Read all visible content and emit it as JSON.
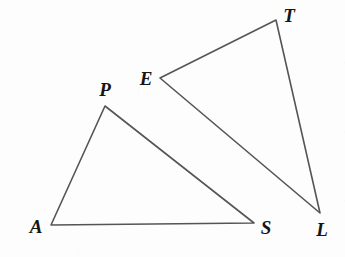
{
  "figure": {
    "type": "geometry-diagram",
    "canvas": {
      "width": 345,
      "height": 257
    },
    "colors": {
      "background": "#fdfdfd",
      "stroke": "#555555",
      "label": "#151515"
    },
    "stroke_width": 1.6,
    "shapes": [
      {
        "name": "triangle-aps",
        "kind": "triangle",
        "vertex_labels": [
          "A",
          "P",
          "S"
        ],
        "points": "51,225 105,106 254,223",
        "vertices": [
          {
            "label": "A",
            "x": 51,
            "y": 225
          },
          {
            "label": "P",
            "x": 105,
            "y": 106
          },
          {
            "label": "S",
            "x": 254,
            "y": 223
          }
        ],
        "edges": [
          "A-P",
          "P-S",
          "S-A"
        ]
      },
      {
        "name": "triangle-etl",
        "kind": "triangle",
        "vertex_labels": [
          "E",
          "T",
          "L"
        ],
        "points": "160,78 276,20 320,213",
        "vertices": [
          {
            "label": "E",
            "x": 160,
            "y": 78
          },
          {
            "label": "T",
            "x": 276,
            "y": 20
          },
          {
            "label": "L",
            "x": 320,
            "y": 213
          }
        ],
        "edges": [
          "E-T",
          "T-L",
          "L-E"
        ]
      }
    ],
    "labels": [
      {
        "name": "vertex-label-a",
        "text": "A",
        "x": 36,
        "y": 226
      },
      {
        "name": "vertex-label-p",
        "text": "P",
        "x": 105,
        "y": 89
      },
      {
        "name": "vertex-label-s",
        "text": "S",
        "x": 266,
        "y": 227
      },
      {
        "name": "vertex-label-e",
        "text": "E",
        "x": 146,
        "y": 78
      },
      {
        "name": "vertex-label-t",
        "text": "T",
        "x": 289,
        "y": 15
      },
      {
        "name": "vertex-label-l",
        "text": "L",
        "x": 322,
        "y": 229
      }
    ]
  }
}
